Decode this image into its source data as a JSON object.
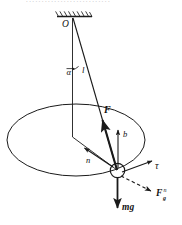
{
  "figure": {
    "title_fragment": "...........................",
    "caption": "Conical pendulum free-body diagram",
    "colors": {
      "ink": "#1a1a1a",
      "background": "#ffffff",
      "label": "#111111"
    },
    "labels": {
      "pivot": "O",
      "angle": "α",
      "length": "l",
      "tension": "F",
      "binormal": "b",
      "normal": "n",
      "tangent": "τ",
      "gravity_normal_base": "F",
      "gravity_normal_sub": "g",
      "gravity_normal_sup": "n",
      "weight": "mg"
    },
    "elements": [
      {
        "name": "ceiling-hatching",
        "type": "support"
      },
      {
        "name": "vertical-axis",
        "type": "construction-line"
      },
      {
        "name": "pendulum-string",
        "type": "line"
      },
      {
        "name": "angle-arc",
        "type": "arc"
      },
      {
        "name": "circular-path-ellipse",
        "type": "ellipse"
      },
      {
        "name": "radius-line",
        "type": "line"
      },
      {
        "name": "pendulum-bob",
        "type": "circle"
      },
      {
        "name": "tension-vector",
        "type": "arrow"
      },
      {
        "name": "binormal-vector",
        "type": "arrow"
      },
      {
        "name": "normal-vector",
        "type": "arrow"
      },
      {
        "name": "tangent-vector",
        "type": "arrow"
      },
      {
        "name": "gravity-normal-vector",
        "type": "dashed-arrow"
      },
      {
        "name": "weight-vector",
        "type": "arrow"
      }
    ]
  }
}
